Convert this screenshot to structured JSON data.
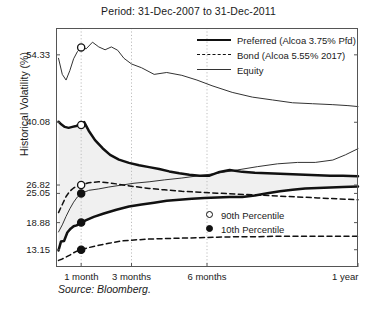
{
  "chart_data": {
    "type": "line",
    "title": "Period: 31-Dec-2007 to 31-Dec-2011",
    "xlabel": "",
    "ylabel": "Historical Volatility (%)",
    "source": "Source: Bloomberg.",
    "grid": "vertical-dotted",
    "legend_position": "top-right",
    "ylim": [
      9.5,
      60.0
    ],
    "xlim": [
      0,
      12
    ],
    "ytick_values": [
      54.33,
      40.08,
      26.82,
      25.05,
      18.88,
      13.15
    ],
    "ytick_labels": [
      "54.33",
      "40.08",
      "26.82",
      "25.05",
      "18.88",
      "13.15"
    ],
    "xtick_values": [
      1,
      3,
      6,
      12
    ],
    "xtick_labels": [
      "1 month",
      "3 months",
      "6 months",
      "1 year"
    ],
    "legend": [
      {
        "label": "Preferred (Alcoa 3.75% Pfd)",
        "style": "solid-thick"
      },
      {
        "label": "Bond (Alcoa 5.55% 2017)",
        "style": "dashed"
      },
      {
        "label": "Equity",
        "style": "solid-thin"
      }
    ],
    "marker_key": [
      {
        "label": "90th Percentile",
        "style": "open-circle"
      },
      {
        "label": "10th Percentile",
        "style": "filled-circle"
      }
    ],
    "annotations": [
      {
        "label": "90th Percentile",
        "series": "Equity",
        "x": 1,
        "y": 55.9
      },
      {
        "label": "90th Percentile",
        "series": "Preferred (Alcoa 3.75% Pfd)",
        "x": 1,
        "y": 39.5
      },
      {
        "label": "90th Percentile",
        "series": "Bond (Alcoa 5.55% 2017)",
        "x": 1,
        "y": 26.82
      },
      {
        "label": "10th Percentile",
        "series": "Equity",
        "x": 1,
        "y": 25.05
      },
      {
        "label": "10th Percentile",
        "series": "Preferred (Alcoa 3.75% Pfd)",
        "x": 1,
        "y": 18.88
      },
      {
        "label": "10th Percentile",
        "series": "Bond (Alcoa 5.55% 2017)",
        "x": 1,
        "y": 13.15
      }
    ],
    "series": [
      {
        "name": "Equity 90th Percentile",
        "group": "Equity",
        "percentile": 90,
        "style": "solid-thin",
        "x": [
          0.1,
          0.25,
          0.4,
          0.55,
          0.7,
          0.85,
          1.0,
          1.2,
          1.45,
          1.7,
          1.95,
          2.2,
          2.45,
          2.7,
          3.0,
          3.4,
          3.9,
          4.4,
          5.0,
          5.6,
          6.2,
          7.0,
          7.8,
          8.6,
          9.4,
          10.2,
          11.0,
          11.6,
          12.0
        ],
        "values": [
          53.6,
          50.2,
          49.0,
          51.0,
          53.5,
          55.0,
          55.9,
          55.6,
          57.0,
          56.0,
          55.4,
          56.0,
          55.3,
          53.6,
          52.4,
          51.6,
          50.2,
          50.6,
          50.0,
          49.0,
          47.8,
          46.4,
          45.4,
          44.8,
          44.2,
          44.0,
          43.8,
          43.6,
          43.4
        ]
      },
      {
        "name": "Equity 10th Percentile",
        "group": "Equity",
        "percentile": 10,
        "style": "solid-thin",
        "x": [
          0.1,
          0.25,
          0.4,
          0.55,
          0.7,
          0.85,
          1.0,
          1.3,
          1.7,
          2.1,
          2.6,
          3.1,
          3.7,
          4.3,
          5.0,
          5.7,
          6.4,
          7.2,
          8.0,
          8.8,
          9.6,
          10.3,
          11.0,
          11.5,
          12.0
        ],
        "values": [
          16.9,
          18.4,
          20.2,
          21.8,
          23.2,
          24.3,
          25.05,
          25.7,
          26.0,
          26.4,
          26.8,
          27.2,
          27.5,
          27.9,
          28.3,
          28.8,
          29.3,
          30.0,
          30.7,
          31.3,
          31.6,
          31.6,
          32.1,
          33.2,
          34.5
        ]
      },
      {
        "name": "Preferred 90th Percentile",
        "group": "Preferred (Alcoa 3.75% Pfd)",
        "percentile": 90,
        "style": "solid-thick",
        "x": [
          0.1,
          0.22,
          0.35,
          0.5,
          0.65,
          0.8,
          0.92,
          1.0,
          1.12,
          1.3,
          1.55,
          1.85,
          2.15,
          2.5,
          2.9,
          3.3,
          3.7,
          4.1,
          4.5,
          4.9,
          5.3,
          5.7,
          6.1,
          6.5,
          6.9,
          7.4,
          7.9,
          8.4,
          8.9,
          9.4,
          9.9,
          10.4,
          10.9,
          11.4,
          12.0
        ],
        "values": [
          40.2,
          39.6,
          39.1,
          38.9,
          39.1,
          39.3,
          39.5,
          39.5,
          40.1,
          38.3,
          36.3,
          34.6,
          33.2,
          32.2,
          31.5,
          31.0,
          30.6,
          30.2,
          29.7,
          29.3,
          29.0,
          28.8,
          28.8,
          29.6,
          30.0,
          29.6,
          29.4,
          29.3,
          29.2,
          29.1,
          29.0,
          28.9,
          28.8,
          28.8,
          28.7
        ]
      },
      {
        "name": "Preferred 10th Percentile",
        "group": "Preferred (Alcoa 3.75% Pfd)",
        "percentile": 10,
        "style": "solid-thick",
        "x": [
          0.1,
          0.2,
          0.32,
          0.45,
          0.58,
          0.7,
          0.82,
          0.92,
          1.0,
          1.2,
          1.5,
          1.9,
          2.4,
          2.9,
          3.4,
          3.9,
          4.4,
          4.9,
          5.4,
          5.9,
          6.4,
          6.9,
          7.4,
          7.9,
          8.4,
          8.9,
          9.4,
          9.9,
          10.4,
          10.9,
          11.4,
          12.0
        ],
        "values": [
          13.0,
          14.9,
          15.0,
          16.8,
          17.6,
          18.1,
          18.3,
          18.6,
          18.88,
          19.4,
          20.1,
          20.8,
          21.6,
          22.3,
          22.7,
          23.1,
          23.5,
          23.7,
          23.9,
          24.1,
          24.2,
          24.3,
          24.3,
          24.6,
          25.1,
          25.5,
          25.8,
          26.1,
          26.2,
          26.3,
          26.4,
          26.5
        ]
      },
      {
        "name": "Bond 90th Percentile",
        "group": "Bond (Alcoa 5.55% 2017)",
        "percentile": 90,
        "style": "dashed",
        "x": [
          0.1,
          0.25,
          0.4,
          0.55,
          0.7,
          0.85,
          1.0,
          1.3,
          1.7,
          2.1,
          2.6,
          3.1,
          3.7,
          4.3,
          5.0,
          5.7,
          6.4,
          7.2,
          8.0,
          8.8,
          9.6,
          10.4,
          11.2,
          12.0
        ],
        "values": [
          21.0,
          22.7,
          24.4,
          25.5,
          26.2,
          26.6,
          26.82,
          27.3,
          27.5,
          27.3,
          26.9,
          26.5,
          26.1,
          25.8,
          25.5,
          25.3,
          25.1,
          24.9,
          24.7,
          24.5,
          24.3,
          24.1,
          23.9,
          23.7
        ]
      },
      {
        "name": "Bond 10th Percentile",
        "group": "Bond (Alcoa 5.55% 2017)",
        "percentile": 10,
        "style": "dashed",
        "x": [
          0.1,
          0.25,
          0.4,
          0.55,
          0.7,
          0.85,
          1.0,
          1.3,
          1.7,
          2.1,
          2.6,
          3.1,
          3.7,
          4.3,
          5.0,
          5.7,
          6.4,
          7.2,
          8.0,
          8.8,
          9.6,
          10.4,
          11.2,
          12.0
        ],
        "values": [
          10.9,
          11.2,
          11.6,
          12.0,
          12.5,
          12.9,
          13.15,
          13.6,
          14.1,
          14.5,
          15.0,
          15.2,
          15.4,
          15.5,
          15.6,
          15.7,
          15.8,
          15.9,
          15.9,
          16.0,
          16.0,
          16.0,
          16.0,
          16.0
        ]
      }
    ],
    "shaded_band": {
      "between": [
        "Preferred 90th Percentile",
        "Preferred 10th Percentile"
      ],
      "color": "#f0f0f0"
    },
    "colors": {
      "line": "#111111",
      "thin_line": "#333333",
      "grid": "#bdbdbd",
      "frame": "#555555",
      "band": "#f0f0f0",
      "text": "#1a1a1a"
    }
  }
}
